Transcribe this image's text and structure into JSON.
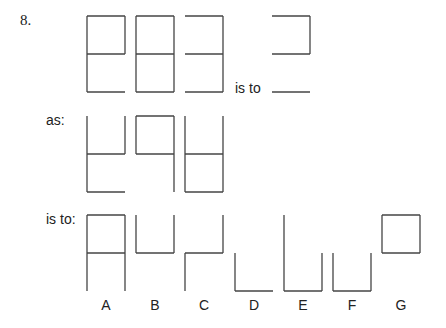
{
  "question_number": "8.",
  "labels": {
    "is_to_1": "is to",
    "as": "as:",
    "is_to_2": "is to:"
  },
  "figures": {
    "row1": [
      {
        "name": "stem-figure-1",
        "segments": [
          "top",
          "top-left",
          "top-right",
          "middle",
          "bottom-left",
          "bottom"
        ]
      },
      {
        "name": "stem-figure-2",
        "segments": [
          "top",
          "top-left",
          "top-right",
          "middle",
          "bottom-left",
          "bottom-right",
          "bottom"
        ]
      },
      {
        "name": "stem-figure-3",
        "segments": [
          "top",
          "top-right",
          "middle",
          "bottom-right",
          "bottom"
        ]
      },
      {
        "name": "target-figure",
        "segments": [
          "top",
          "top-right",
          "middle",
          "bottom"
        ]
      }
    ],
    "row2": [
      {
        "name": "as-figure-1",
        "segments": [
          "top-left",
          "top-right",
          "middle",
          "bottom-left",
          "bottom"
        ]
      },
      {
        "name": "as-figure-2",
        "segments": [
          "top",
          "top-left",
          "top-right",
          "middle",
          "bottom-right"
        ]
      },
      {
        "name": "as-figure-3",
        "segments": [
          "top-left",
          "top-right",
          "middle",
          "bottom-left",
          "bottom-right",
          "bottom"
        ]
      }
    ],
    "options": [
      {
        "label": "A",
        "segments": [
          "top",
          "top-left",
          "top-right",
          "middle",
          "bottom-left",
          "bottom-right"
        ]
      },
      {
        "label": "B",
        "segments": [
          "top-left",
          "top-right",
          "middle"
        ]
      },
      {
        "label": "C",
        "segments": [
          "top-right",
          "middle",
          "bottom-left"
        ]
      },
      {
        "label": "D",
        "segments": [
          "bottom-left",
          "bottom"
        ]
      },
      {
        "label": "E",
        "segments": [
          "top-left",
          "bottom-left",
          "bottom",
          "bottom-right"
        ]
      },
      {
        "label": "F",
        "segments": [
          "bottom-left",
          "bottom",
          "bottom-right"
        ]
      },
      {
        "label": "G",
        "segments": [
          "top",
          "top-left",
          "top-right",
          "middle"
        ]
      }
    ]
  }
}
